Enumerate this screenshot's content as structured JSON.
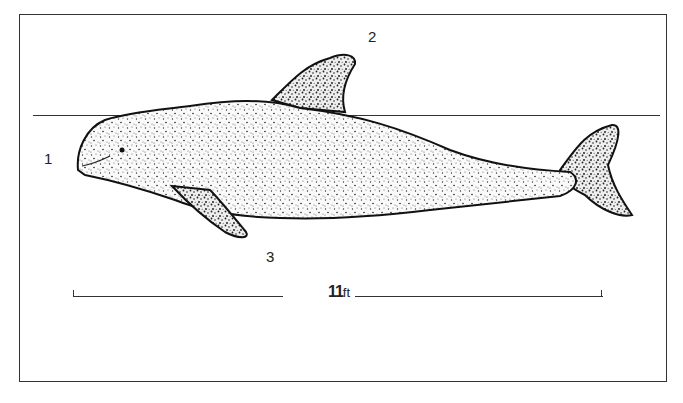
{
  "figure": {
    "labels": [
      {
        "id": "1",
        "text": "1"
      },
      {
        "id": "2",
        "text": "2"
      },
      {
        "id": "3",
        "text": "3"
      }
    ],
    "scale_bar": {
      "value": "11",
      "unit": "ft"
    }
  }
}
